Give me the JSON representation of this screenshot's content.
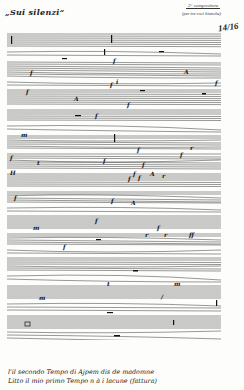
{
  "document": {
    "title": "„Sui silenzi“",
    "header_annotation": {
      "line1": "2° compositore",
      "line2": "(per tre voci bianche)"
    },
    "page_number": "14/16",
    "score": {
      "systems": 14,
      "dynamics_markings": [
        "f",
        "f",
        "p",
        "A",
        "f",
        "f",
        "A",
        "f",
        "m",
        "f",
        "f",
        "ff",
        "m",
        "f",
        "p",
        "m",
        "m",
        "m",
        "f",
        "m",
        "f",
        "m"
      ]
    },
    "footer_text": {
      "line1": "l'il secondo Tempo di Ajpem dis de madomne",
      "line2": "Litto il mio primo Tempo n à i lacune (fattura)"
    }
  }
}
